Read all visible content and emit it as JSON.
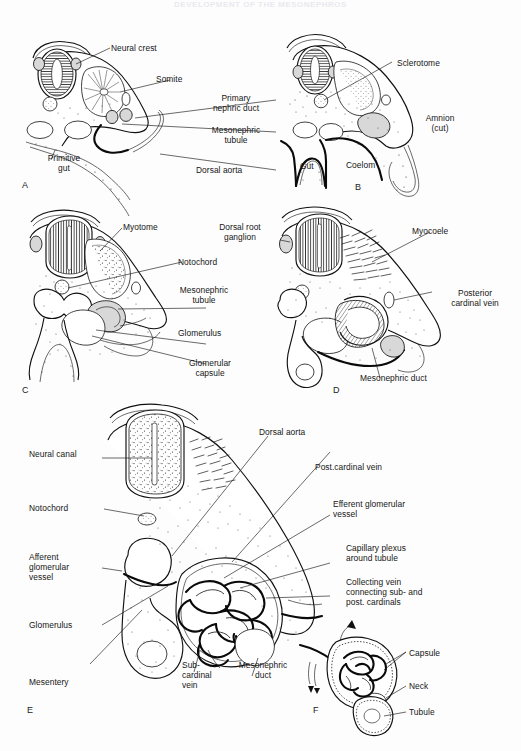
{
  "figure": {
    "running_head": "DEVELOPMENT OF THE MESONEPHROS",
    "background_color": "#ffffff",
    "ink_color": "#161616"
  },
  "panels": [
    {
      "letter": "A",
      "name": "panel-a"
    },
    {
      "letter": "B",
      "name": "panel-b"
    },
    {
      "letter": "C",
      "name": "panel-c"
    },
    {
      "letter": "D",
      "name": "panel-d"
    },
    {
      "letter": "E",
      "name": "panel-e"
    },
    {
      "letter": "F",
      "name": "panel-f"
    }
  ],
  "labels": {
    "a": [
      {
        "id": "neural-crest",
        "text": "Neural crest"
      },
      {
        "id": "somite",
        "text": "Somite"
      },
      {
        "id": "primary-nephric-duct",
        "text": "Primary\nnephric duct"
      },
      {
        "id": "mesonephric-tubule",
        "text": "Mesonephric\ntubule"
      },
      {
        "id": "dorsal-aorta",
        "text": "Dorsal aorta"
      },
      {
        "id": "primitive-gut",
        "text": "Primitive\ngut"
      }
    ],
    "b": [
      {
        "id": "sclerotome",
        "text": "Sclerotome"
      },
      {
        "id": "amnion-cut",
        "text": "Amnion\n(cut)"
      },
      {
        "id": "coelom",
        "text": "Coelom"
      },
      {
        "id": "gut",
        "text": "Gut"
      }
    ],
    "c": [
      {
        "id": "myotome",
        "text": "Myotome"
      },
      {
        "id": "notochord",
        "text": "Notochord"
      },
      {
        "id": "mesonephric-tubule",
        "text": "Mesonephric\ntubule"
      },
      {
        "id": "glomerulus",
        "text": "Glomerulus"
      },
      {
        "id": "glomerular-capsule",
        "text": "Glomerular\ncapsule"
      }
    ],
    "d": [
      {
        "id": "dorsal-root-ganglion",
        "text": "Dorsal root\nganglion"
      },
      {
        "id": "myocoele",
        "text": "Myocoele"
      },
      {
        "id": "posterior-cardinal-vein",
        "text": "Posterior\ncardinal vein"
      },
      {
        "id": "mesonephric-duct",
        "text": "Mesonephric duct"
      }
    ],
    "e": [
      {
        "id": "neural-canal",
        "text": "Neural canal"
      },
      {
        "id": "notochord",
        "text": "Notochord"
      },
      {
        "id": "afferent-glomerular-vessel",
        "text": "Afferent\nglomerular\nvessel"
      },
      {
        "id": "glomerulus",
        "text": "Glomerulus"
      },
      {
        "id": "mesentery",
        "text": "Mesentery"
      },
      {
        "id": "dorsal-aorta",
        "text": "Dorsal aorta"
      },
      {
        "id": "post-cardinal-vein",
        "text": "Post.cardinal vein"
      },
      {
        "id": "efferent-glomerular-vessel",
        "text": "Efferent glomerular\nvessel"
      },
      {
        "id": "capillary-plexus",
        "text": "Capillary plexus\naround tubule"
      },
      {
        "id": "collecting-vein",
        "text": "Collecting vein\nconnecting sub- and\npost. cardinals"
      },
      {
        "id": "sub-cardinal-vein",
        "text": "Sub-\ncardinal\nvein"
      },
      {
        "id": "mesonephric-duct",
        "text": "Mesonephric\nduct"
      }
    ],
    "f": [
      {
        "id": "capsule",
        "text": "Capsule"
      },
      {
        "id": "neck",
        "text": "Neck"
      },
      {
        "id": "tubule",
        "text": "Tubule"
      }
    ]
  }
}
